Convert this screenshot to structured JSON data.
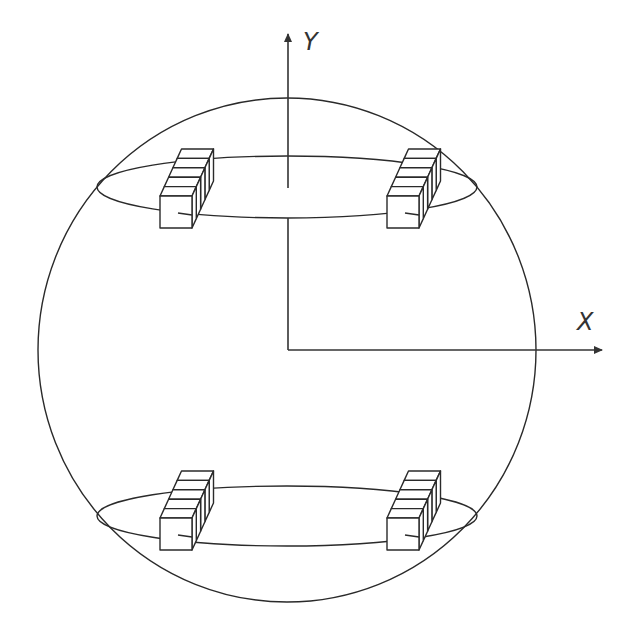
{
  "diagram": {
    "axes": {
      "y_label": "Y",
      "x_label": "X",
      "origin": [
        288,
        350
      ]
    },
    "sphere": {
      "cx": 287,
      "cy": 350,
      "rx": 249,
      "ry": 252
    },
    "rings": [
      {
        "name": "upper-ring",
        "cx": 287,
        "cy": 187,
        "rx": 190,
        "ry": 31
      },
      {
        "name": "lower-ring",
        "cx": 287,
        "cy": 516,
        "rx": 190,
        "ry": 30
      }
    ],
    "modules": [
      {
        "name": "upper-left-module",
        "x": 160,
        "y": 196
      },
      {
        "name": "upper-right-module",
        "x": 387,
        "y": 196
      },
      {
        "name": "lower-left-module",
        "x": 160,
        "y": 518
      },
      {
        "name": "lower-right-module",
        "x": 387,
        "y": 518
      }
    ],
    "module_slabs": 5,
    "stroke_color": "#2a2a2a",
    "background": "#ffffff"
  }
}
